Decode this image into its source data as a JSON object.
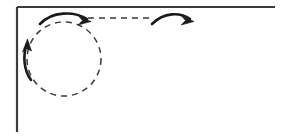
{
  "figure": {
    "canvas": {
      "width": 282,
      "height": 138,
      "background": "#ffffff"
    },
    "ink_color": "#1a1a1a",
    "frame": {
      "name": "L-shaped rule frame",
      "stroke": "#3c3c3c",
      "stroke_width": 2.2,
      "top_rule": {
        "x1": 17,
        "y1": 7,
        "x2": 275,
        "y2": 7
      },
      "left_rule": {
        "x1": 17,
        "y1": 7,
        "x2": 17,
        "y2": 132
      }
    },
    "dashed_circle": {
      "name": "dashed loop path",
      "cx": 64,
      "cy": 59,
      "r": 37,
      "stroke": "#3a3a3a",
      "stroke_width": 1.5,
      "dash_pattern": "6 5"
    },
    "dashed_line": {
      "name": "dashed straight path",
      "x1": 88,
      "y1": 18,
      "x2": 150,
      "y2": 18,
      "stroke": "#3a3a3a",
      "stroke_width": 1.5,
      "dash_pattern": "6 5"
    },
    "arrows": [
      {
        "name": "loop-top-arrow",
        "direction": "left-to-right over loop top",
        "path": "M 40 24 C 52 11 74 11 87 19",
        "stroke_width": 2.6,
        "head": {
          "x": 90,
          "y": 21,
          "angle": 38
        }
      },
      {
        "name": "loop-left-arrow",
        "direction": "upward along loop left side",
        "path": "M 31 80 C 23 69 23 54 27 44",
        "stroke_width": 2.6,
        "head": {
          "x": 28,
          "y": 40,
          "angle": -18
        }
      },
      {
        "name": "exit-arrow",
        "direction": "rightward after dashed path",
        "path": "M 152 24 C 164 12 180 12 190 19",
        "stroke_width": 2.6,
        "head": {
          "x": 193,
          "y": 21,
          "angle": 36
        }
      }
    ]
  }
}
